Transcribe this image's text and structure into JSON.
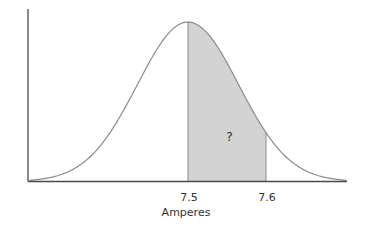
{
  "chart_data": {
    "type": "area",
    "title": "",
    "xlabel": "Amperes",
    "ylabel": "",
    "distribution": "normal",
    "mean": 7.5,
    "std": 0.065,
    "xlim": [
      7.297,
      7.703
    ],
    "shaded_region": [
      7.5,
      7.6
    ],
    "x_ticks": [
      {
        "value": 7.5,
        "label": "7.5"
      },
      {
        "value": 7.6,
        "label": "7.6"
      }
    ],
    "annotations": [
      {
        "text": "?",
        "x": 7.553,
        "y_fraction": 0.28
      }
    ],
    "grid": false,
    "legend": "none",
    "colors": {
      "axis": "#4a4a4a",
      "curve": "#8a8a8a",
      "shade": "#d3d3d3",
      "shade_edge": "#8a8a8a"
    }
  }
}
